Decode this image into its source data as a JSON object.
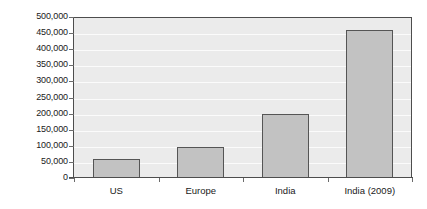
{
  "chart_data": {
    "type": "bar",
    "title": "",
    "subtitle": "",
    "xlabel": "",
    "ylabel": "",
    "categories": [
      "US",
      "Europe",
      "India",
      "India (2009)"
    ],
    "values": [
      60000,
      95000,
      200000,
      460000
    ],
    "series": [
      {
        "name": "",
        "values": [
          60000,
          95000,
          200000,
          460000
        ]
      }
    ],
    "ylim": [
      0,
      500000
    ],
    "ytick_values": [
      0,
      50000,
      100000,
      150000,
      200000,
      250000,
      300000,
      350000,
      400000,
      450000,
      500000
    ],
    "ytick_labels": [
      "500,000",
      "450,000",
      "400,000",
      "350,000",
      "300,000",
      "250,000",
      "200,000",
      "150,000",
      "100,000",
      "50,000",
      "0"
    ],
    "grid": true,
    "grid_orientation": "horizontal",
    "legend": false,
    "legend_position": "none",
    "annotations": [],
    "colors": {
      "bar_fill": "#c2c2c2",
      "bar_border": "#555555",
      "plot_background": "#ebebeb",
      "gridline": "#fbfbfb",
      "axis": "#4d4d4d",
      "tick_label": "#1a1a1a",
      "figure_background": "#ffffff"
    }
  }
}
